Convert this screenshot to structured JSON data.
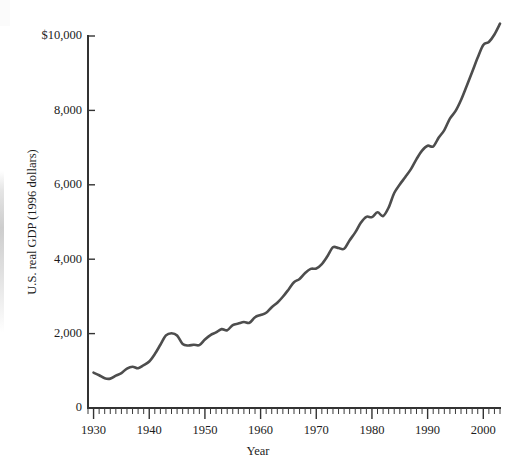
{
  "chart_data": {
    "type": "line",
    "title": "",
    "xlabel": "Year",
    "ylabel": "U.S. real GDP (1996 dollars)",
    "xlim": [
      1929,
      2003
    ],
    "ylim": [
      0,
      10000
    ],
    "grid": false,
    "legend": null,
    "xticks": [
      1930,
      1940,
      1950,
      1960,
      1970,
      1980,
      1990,
      2000
    ],
    "xtick_labels": [
      "1930",
      "1940",
      "1950",
      "1960",
      "1970",
      "1980",
      "1990",
      "2000"
    ],
    "x_minor_tick_interval": 1,
    "yticks": [
      0,
      2000,
      4000,
      6000,
      8000,
      10000
    ],
    "ytick_labels": [
      "0",
      "2,000",
      "4,000",
      "6,000",
      "8,000",
      "$10,000"
    ],
    "series": [
      {
        "name": "U.S. real GDP (1996 dollars)",
        "color": "#4d4d4d",
        "x": [
          1930,
          1931,
          1932,
          1933,
          1934,
          1935,
          1936,
          1937,
          1938,
          1939,
          1940,
          1941,
          1942,
          1943,
          1944,
          1945,
          1946,
          1947,
          1948,
          1949,
          1950,
          1951,
          1952,
          1953,
          1954,
          1955,
          1956,
          1957,
          1958,
          1959,
          1960,
          1961,
          1962,
          1963,
          1964,
          1965,
          1966,
          1967,
          1968,
          1969,
          1970,
          1971,
          1972,
          1973,
          1974,
          1975,
          1976,
          1977,
          1978,
          1979,
          1980,
          1981,
          1982,
          1983,
          1984,
          1985,
          1986,
          1987,
          1988,
          1989,
          1990,
          1991,
          1992,
          1993,
          1994,
          1995,
          1996,
          1997,
          1998,
          1999,
          2000,
          2001,
          2002,
          2003
        ],
        "values": [
          950,
          880,
          800,
          790,
          870,
          940,
          1060,
          1110,
          1070,
          1150,
          1250,
          1450,
          1700,
          1950,
          2010,
          1950,
          1720,
          1680,
          1700,
          1690,
          1840,
          1960,
          2030,
          2120,
          2090,
          2230,
          2270,
          2310,
          2290,
          2440,
          2500,
          2560,
          2710,
          2830,
          2990,
          3180,
          3380,
          3470,
          3630,
          3740,
          3750,
          3870,
          4080,
          4320,
          4300,
          4280,
          4510,
          4720,
          4980,
          5140,
          5130,
          5260,
          5160,
          5390,
          5780,
          6010,
          6210,
          6420,
          6690,
          6920,
          7050,
          7030,
          7270,
          7470,
          7780,
          7980,
          8280,
          8650,
          9030,
          9420,
          9760,
          9840,
          10040,
          10330
        ]
      }
    ]
  },
  "axes": {
    "x_axis_label": "Year",
    "y_axis_label": "U.S. real GDP (1996 dollars)"
  }
}
